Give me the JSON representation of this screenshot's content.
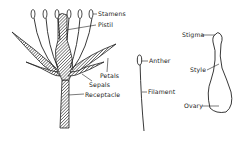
{
  "diagram": {
    "type": "botanical-flower-anatomy",
    "panels": [
      {
        "id": "whole-flower",
        "labels": [
          {
            "text": "Stamens",
            "x": 98,
            "y": 11
          },
          {
            "text": "Pistil",
            "x": 98,
            "y": 22
          },
          {
            "text": "Petals",
            "x": 100,
            "y": 73
          },
          {
            "text": "Sepals",
            "x": 89,
            "y": 82
          },
          {
            "text": "Receptacle",
            "x": 85,
            "y": 93
          }
        ]
      },
      {
        "id": "stamen-detail",
        "labels": [
          {
            "text": "Anther",
            "x": 149,
            "y": 58
          },
          {
            "text": "Filament",
            "x": 148,
            "y": 88
          }
        ]
      },
      {
        "id": "pistil-detail",
        "labels": [
          {
            "text": "Stigma",
            "x": 183,
            "y": 32
          },
          {
            "text": "Style",
            "x": 190,
            "y": 67
          },
          {
            "text": "Ovary",
            "x": 184,
            "y": 104
          }
        ]
      }
    ],
    "colors": {
      "ink": "#222222",
      "hatch": "#555555",
      "background": "#ffffff"
    }
  }
}
